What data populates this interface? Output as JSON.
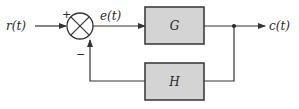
{
  "diagram": {
    "type": "feedback-control-block-diagram",
    "input_label": "r(t)",
    "error_label": "e(t)",
    "output_label": "c(t)",
    "forward_block": {
      "label": "G",
      "fill": "#d4d4d4"
    },
    "feedback_block": {
      "label": "H",
      "fill": "#d4d4d4"
    },
    "summing_junction": {
      "plus_sign": "+",
      "minus_sign": "−"
    },
    "colors": {
      "line": "#333333",
      "block_border": "#333333",
      "block_fill": "#d4d4d4"
    }
  }
}
